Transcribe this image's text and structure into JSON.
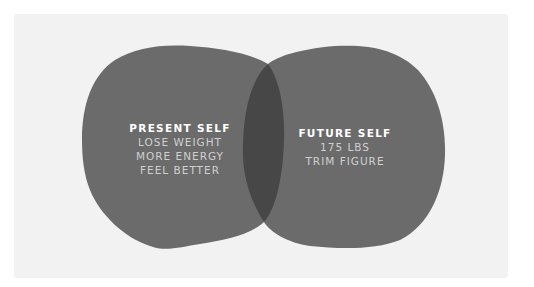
{
  "diagram": {
    "type": "venn",
    "colors": {
      "background": "#f2f2f2",
      "circle_fill": "#6b6b6b",
      "intersection_fill": "#474747",
      "title_text": "#ffffff",
      "item_text": "#d0d0d0"
    },
    "sets": [
      {
        "title": "PRESENT SELF",
        "items": [
          "LOSE WEIGHT",
          "MORE ENERGY",
          "FEEL BETTER"
        ]
      },
      {
        "title": "FUTURE SELF",
        "items": [
          "175 LBS",
          "TRIM FIGURE"
        ]
      }
    ],
    "intersection": {
      "label": ""
    }
  }
}
